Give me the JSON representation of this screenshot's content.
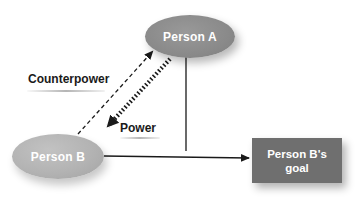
{
  "diagram": {
    "type": "power-relationship",
    "nodes": {
      "person_a": {
        "label": "Person A",
        "shape": "ellipse",
        "color": "#8a8a8a"
      },
      "person_b": {
        "label": "Person B",
        "shape": "ellipse",
        "color": "#b3b3b3"
      },
      "goal": {
        "label_line1": "Person B's",
        "label_line2": "goal",
        "shape": "rectangle",
        "color": "#6f6f6f"
      }
    },
    "edges": [
      {
        "from": "person_a",
        "to": "person_b",
        "label": "Power",
        "style": "thick-dotted"
      },
      {
        "from": "person_b",
        "to": "person_a",
        "label": "Counterpower",
        "style": "dashed"
      },
      {
        "from": "person_b",
        "to": "goal",
        "label": "",
        "style": "solid"
      },
      {
        "from": "person_a",
        "to": "person_b-goal-edge",
        "label": "",
        "style": "solid-line"
      }
    ],
    "labels": {
      "counterpower": "Counterpower",
      "power": "Power"
    }
  }
}
